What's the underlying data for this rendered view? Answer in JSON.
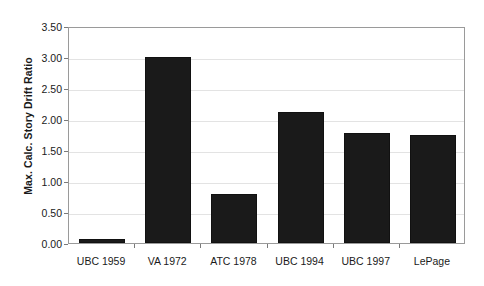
{
  "chart_data": {
    "type": "bar",
    "title": "",
    "subtitle": "",
    "xlabel": "",
    "ylabel": "Max. Calc. Story Drift Ratio",
    "categories": [
      "UBC 1959",
      "VA 1972",
      "ATC 1978",
      "UBC 1994",
      "UBC 1997",
      "LePage"
    ],
    "values": [
      0.06,
      3.0,
      0.79,
      2.11,
      1.78,
      1.74
    ],
    "ylim": [
      0.0,
      3.5
    ],
    "ytick_values": [
      0.0,
      0.5,
      1.0,
      1.5,
      2.0,
      2.5,
      3.0,
      3.5
    ],
    "ytick_labels": [
      "0.00",
      "0.50",
      "1.00",
      "1.50",
      "2.00",
      "2.50",
      "3.00",
      "3.50"
    ],
    "grid": true,
    "grid_axis": "y",
    "legend": false,
    "legend_position": "none",
    "series": [
      {
        "name": "Max. Calc. Story Drift Ratio",
        "values": [
          0.06,
          3.0,
          0.79,
          2.11,
          1.78,
          1.74
        ]
      }
    ]
  },
  "colors": {
    "bar_fill": "#1a1a1a",
    "bar_stroke": "#111111",
    "plot_border": "#9a9a9a",
    "gridline": "#e3e3e3",
    "tick_mark": "#7a7a7a",
    "text": "#1a1a1a",
    "background": "#ffffff"
  }
}
